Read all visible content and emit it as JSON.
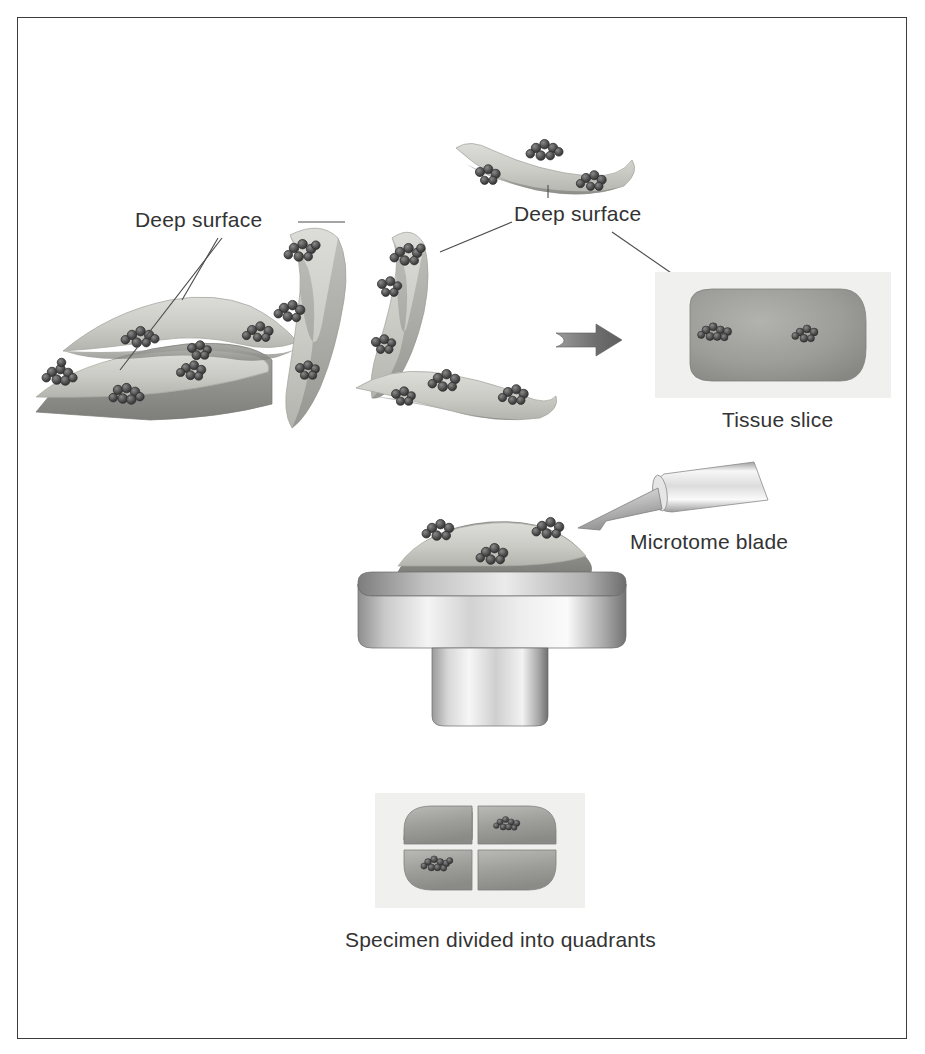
{
  "figure": {
    "title_alt": "Tissue specimen processing diagram",
    "border_color": "#3c3c3c",
    "background": "#ffffff"
  },
  "palette": {
    "tissue_light": "#cdcdc9",
    "tissue_mid": "#9c9c9c",
    "tissue_dark": "#7d7d7d",
    "cell_cluster_dark": "#4a4a4a",
    "cell_cluster_outline": "#2f2f2f",
    "metal_light": "#f2f2f2",
    "metal_mid": "#b8b8b8",
    "metal_dark": "#6e6e6e",
    "panel_bg": "#f0f0ee",
    "leader_line": "#4a4a4a",
    "arrow_gray": "#707070",
    "text": "#333333"
  },
  "labels": {
    "deep_surface_left": "Deep surface",
    "deep_surface_right": "Deep surface",
    "tissue_slice": "Tissue slice",
    "microtome_blade": "Microtome blade",
    "specimen_quadrants": "Specimen divided into quadrants"
  },
  "panels": {
    "tissue_slice_panel": {
      "x": 655,
      "y": 272,
      "w": 236,
      "h": 126
    },
    "quadrant_panel": {
      "x": 375,
      "y": 793,
      "w": 210,
      "h": 115
    }
  },
  "icons": {
    "process_arrow": "arrow-right-icon",
    "blade": "microtome-blade-icon",
    "chuck": "specimen-chuck-icon"
  },
  "fragments": [
    {
      "name": "fragment-flat-slab-bottom-left",
      "clusters": 3
    },
    {
      "name": "fragment-curved-left",
      "clusters": 3
    },
    {
      "name": "fragment-curved-upper-middle",
      "clusters": 3
    },
    {
      "name": "fragment-curved-right-of-middle",
      "clusters": 3
    },
    {
      "name": "fragment-top-arc",
      "clusters": 3
    },
    {
      "name": "fragment-bottom-arc",
      "clusters": 3
    }
  ],
  "tissue_slice_clusters": 2,
  "quadrant_clusters": 2,
  "quadrant_count": 4
}
